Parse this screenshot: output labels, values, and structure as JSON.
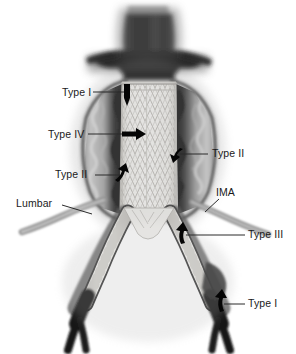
{
  "figure": {
    "name": "endoleak-types-aortic-stent-graft",
    "background_color": "#ffffff",
    "width": 296,
    "height": 354,
    "modality": "grayscale-medical-illustration"
  },
  "labels": [
    {
      "id": "type-1-proximal",
      "text": "Type I",
      "x": 62,
      "y": 87,
      "align": "left",
      "leader": {
        "x1": 93,
        "y1": 92,
        "x2": 126,
        "y2": 92
      },
      "arrow": {
        "x": 127,
        "y": 90,
        "dir": "down"
      }
    },
    {
      "id": "type-4",
      "text": "Type IV",
      "x": 48,
      "y": 129,
      "align": "left",
      "leader": {
        "x1": 88,
        "y1": 134,
        "x2": 124,
        "y2": 134
      },
      "arrow": {
        "x": 126,
        "y": 134,
        "dir": "right"
      }
    },
    {
      "id": "type-2-right",
      "text": "Type II",
      "x": 212,
      "y": 149,
      "align": "left",
      "leader": {
        "x1": 208,
        "y1": 154,
        "x2": 178,
        "y2": 154
      },
      "arrow": {
        "x": 176,
        "y": 152,
        "dir": "left-down"
      }
    },
    {
      "id": "type-2-left",
      "text": "Type II",
      "x": 55,
      "y": 170,
      "align": "left",
      "leader": {
        "x1": 95,
        "y1": 175,
        "x2": 120,
        "y2": 175
      },
      "arrow": {
        "x": 122,
        "y": 176,
        "dir": "right-up"
      }
    },
    {
      "id": "lumbar",
      "text": "Lumbar",
      "x": 16,
      "y": 198,
      "align": "left",
      "leader": {
        "x1": 62,
        "y1": 206,
        "x2": 92,
        "y2": 214
      },
      "arrow": null
    },
    {
      "id": "ima",
      "text": "IMA",
      "x": 216,
      "y": 187,
      "align": "left",
      "leader": {
        "x1": 219,
        "y1": 198,
        "x2": 204,
        "y2": 212
      },
      "arrow": null
    },
    {
      "id": "type-3",
      "text": "Type III",
      "x": 248,
      "y": 230,
      "align": "left",
      "leader": {
        "x1": 245,
        "y1": 235,
        "x2": 184,
        "y2": 235
      },
      "arrow": {
        "x": 180,
        "y": 238,
        "dir": "up-hook"
      }
    },
    {
      "id": "type-1-distal",
      "text": "Type I",
      "x": 248,
      "y": 299,
      "align": "left",
      "leader": {
        "x1": 245,
        "y1": 304,
        "x2": 222,
        "y2": 304
      },
      "arrow": {
        "x": 218,
        "y": 306,
        "dir": "up-hook"
      }
    }
  ],
  "anatomy": {
    "aorta_proximal": "suprarenal aorta, dense dark contrast",
    "renal_arteries": "bilateral lateral branches at aortic neck",
    "aneurysm_sac": "fusiform dilation with mural thrombus and calcification",
    "stent_graft": "central bifurcated endograft with zigzag stent mesh",
    "iliac_limbs": "two graft limbs extending into common iliac arteries",
    "distal_vessels": "dark native iliac/femoral runoff branches"
  },
  "colors": {
    "background": "#ffffff",
    "vessel_dark": "#171717",
    "vessel_mid": "#555555",
    "sac_lumen": "#1e1e1e",
    "thrombus_light": "#c9c9c9",
    "thrombus_mid": "#9a9a9a",
    "graft_fill": "#f2f1ee",
    "graft_line": "#b9b7b2",
    "label_text": "#1a1a1a",
    "leader_line": "#2b2b2b"
  }
}
